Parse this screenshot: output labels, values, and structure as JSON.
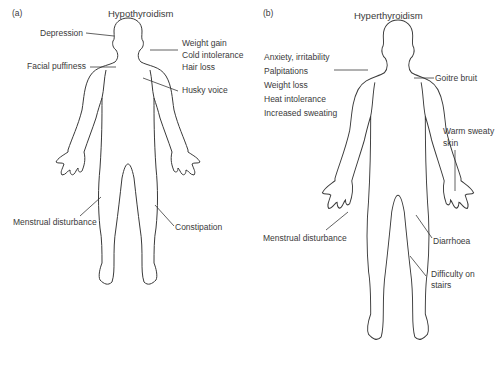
{
  "panel_a": {
    "tag": "(a)",
    "title": "Hypothyroidism",
    "labels": {
      "depression": "Depression",
      "facial_puffiness": "Facial puffiness",
      "weight_gain": "Weight gain",
      "cold_intolerance": "Cold intolerance",
      "hair_loss": "Hair loss",
      "husky_voice": "Husky voice",
      "menstrual": "Menstrual disturbance",
      "constipation": "Constipation"
    }
  },
  "panel_b": {
    "tag": "(b)",
    "title": "Hyperthyroidism",
    "labels": {
      "anxiety": "Anxiety, irritability",
      "palpitations": "Palpitations",
      "weight_loss": "Weight loss",
      "heat_intolerance": "Heat intolerance",
      "sweating": "Increased sweating",
      "goitre": "Goitre bruit",
      "warm_skin_1": "Warm sweaty",
      "warm_skin_2": "skin",
      "menstrual": "Menstrual disturbance",
      "diarrhoea": "Diarrhoea",
      "stairs_1": "Difficulty on",
      "stairs_2": "stairs"
    }
  },
  "colors": {
    "outline": "#3a3a3a",
    "text": "#3a3a3a",
    "background": "#ffffff"
  }
}
